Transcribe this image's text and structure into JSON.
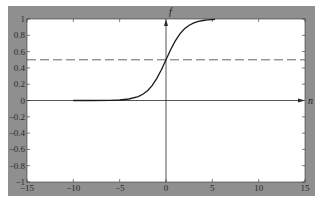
{
  "colors": {
    "frame": "#8f8f8f",
    "plot_bg": "#ffffff",
    "curve": "#1a1a1a",
    "axis": "#2a2a2a",
    "dashed": "#555555",
    "tick_text": "#2a2a2a"
  },
  "chart_data": {
    "type": "line",
    "title": "",
    "xlabel": "n",
    "ylabel": "f",
    "xlim": [
      -15,
      15
    ],
    "ylim": [
      -1,
      1
    ],
    "grid": false,
    "legend": null,
    "x_ticks": [
      -15,
      -10,
      -5,
      0,
      5,
      10,
      15
    ],
    "x_tick_labels": [
      "−15",
      "−10",
      "−5",
      "0",
      "5",
      "10",
      "15"
    ],
    "y_ticks": [
      -1,
      -0.8,
      -0.6,
      -0.4,
      -0.2,
      0,
      0.2,
      0.4,
      0.6,
      0.8,
      1
    ],
    "y_tick_labels": [
      "−1",
      "−0.8",
      "−0.6",
      "−0.4",
      "−0.2",
      "0",
      "0.2",
      "0.4",
      "0.6",
      "0.8",
      "1"
    ],
    "series": [
      {
        "name": "f(n) = 1/(1+e^(−n))",
        "style": "solid",
        "x": [
          -10,
          -8,
          -6,
          -5,
          -4,
          -3,
          -2.5,
          -2,
          -1.5,
          -1,
          -0.5,
          0,
          0.5,
          1,
          1.5,
          2,
          2.5,
          3,
          3.5,
          4,
          4.5,
          5,
          5.3
        ],
        "y": [
          5e-05,
          0.0003,
          0.0025,
          0.0067,
          0.018,
          0.047,
          0.076,
          0.119,
          0.182,
          0.269,
          0.378,
          0.5,
          0.622,
          0.731,
          0.818,
          0.881,
          0.924,
          0.953,
          0.971,
          0.982,
          0.989,
          0.993,
          0.995
        ]
      },
      {
        "name": "f = 0.5",
        "style": "dashed",
        "x": [
          -15,
          15
        ],
        "y": [
          0.5,
          0.5
        ]
      }
    ],
    "annotations": [
      {
        "text": "f",
        "position": "top of vertical axis"
      },
      {
        "text": "n",
        "position": "right end of horizontal axis"
      }
    ]
  },
  "labels": {
    "x_axis_name": "n",
    "y_axis_name": "f"
  }
}
